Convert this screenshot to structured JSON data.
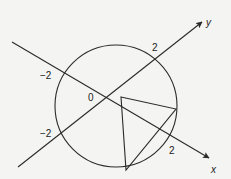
{
  "diagram": {
    "type": "geometry",
    "colors": {
      "stroke": "#2a2a2a",
      "background": "#f4f4f2"
    },
    "axes": {
      "x": {
        "name": "x"
      },
      "y": {
        "name": "y"
      }
    },
    "labels": {
      "origin": "0",
      "x_pos": "2",
      "x_neg": "−2",
      "y_pos": "2",
      "y_neg": "−2"
    },
    "circle": {
      "radius_units": 2
    },
    "triangle": {
      "vertices_count": 3
    }
  }
}
